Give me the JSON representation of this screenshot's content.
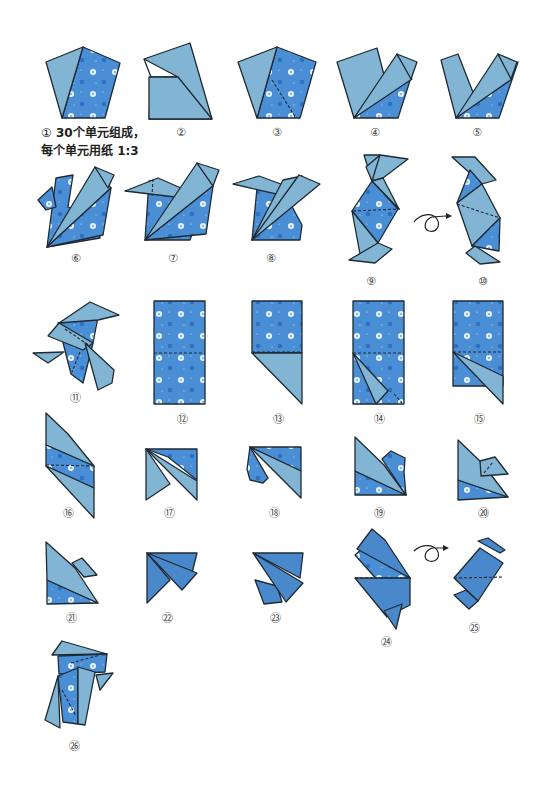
{
  "page": {
    "type": "origami-instructions",
    "colors": {
      "paper_plain": "#82b4d4",
      "paper_pattern": "#4a8fd6",
      "outline": "#1f2a33",
      "dot": "#eaf4ff",
      "background": "#ffffff"
    }
  },
  "caption": {
    "step_marker": "①",
    "line1": "30个单元组成，",
    "line2": "每个单元用纸 1:3"
  },
  "steps": [
    {
      "label": "①"
    },
    {
      "label": "②"
    },
    {
      "label": "③"
    },
    {
      "label": "④"
    },
    {
      "label": "⑤"
    },
    {
      "label": "⑥"
    },
    {
      "label": "⑦"
    },
    {
      "label": "⑧"
    },
    {
      "label": "⑨"
    },
    {
      "label": "⑩"
    },
    {
      "label": "⑪"
    },
    {
      "label": "⑫"
    },
    {
      "label": "⑬"
    },
    {
      "label": "⑭"
    },
    {
      "label": "⑮"
    },
    {
      "label": "⑯"
    },
    {
      "label": "⑰"
    },
    {
      "label": "⑱"
    },
    {
      "label": "⑲"
    },
    {
      "label": "⑳"
    },
    {
      "label": "㉑"
    },
    {
      "label": "㉒"
    },
    {
      "label": "㉓"
    },
    {
      "label": "㉔"
    },
    {
      "label": "㉕"
    },
    {
      "label": "㉖"
    }
  ],
  "symbols": {
    "turn_over_1": "turn-over-arrow",
    "turn_over_2": "turn-over-arrow"
  }
}
